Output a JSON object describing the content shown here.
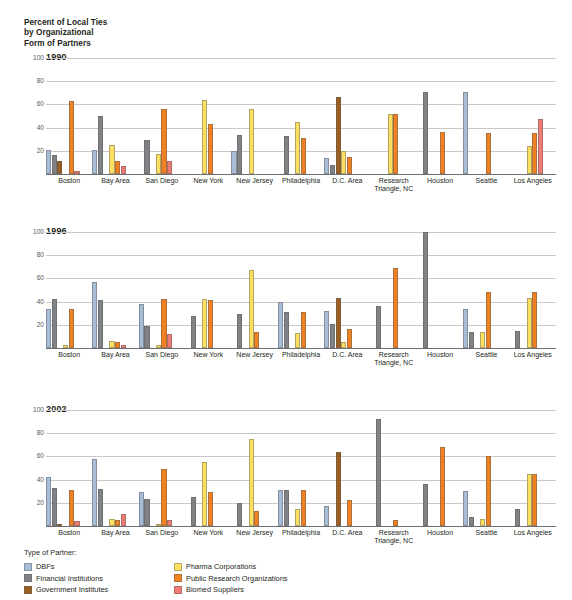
{
  "title_lines": [
    "Percent of Local Ties",
    "by Organizational",
    "Form of Partners"
  ],
  "legend": {
    "heading": "Type of Partner:",
    "columns": [
      [
        {
          "label": "DBFs",
          "color": "#a7bcd6"
        },
        {
          "label": "Financial Institutions",
          "color": "#808285"
        },
        {
          "label": "Government Institutes",
          "color": "#9c5f22"
        }
      ],
      [
        {
          "label": "Pharma Corporations",
          "color": "#fbdf62"
        },
        {
          "label": "Public Research Organizations",
          "color": "#ef8122"
        },
        {
          "label": "Biomed Suppliers",
          "color": "#ef7b74"
        }
      ]
    ]
  },
  "chart_data": {
    "type": "bar",
    "title": "Percent of Local Ties by Organizational Form of Partners",
    "xlabel": "",
    "ylabel": "Percent",
    "ylim": [
      0,
      100
    ],
    "yticks": [
      0,
      20,
      40,
      60,
      80,
      100
    ],
    "ytick_labels": [
      "",
      "20",
      "40",
      "60",
      "80",
      "100"
    ],
    "grid": true,
    "legend_position": "bottom-left",
    "categories": [
      "Boston",
      "Bay Area",
      "San Diego",
      "New York",
      "New Jersey",
      "Philadelphia",
      "D.C. Area",
      "Research Triangle, NC",
      "Houston",
      "Seattle",
      "Los Angeles"
    ],
    "category_lines": [
      [
        "Boston"
      ],
      [
        "Bay Area"
      ],
      [
        "San Diego"
      ],
      [
        "New York"
      ],
      [
        "New Jersey"
      ],
      [
        "Philadelphia"
      ],
      [
        "D.C. Area"
      ],
      [
        "Research",
        "Triangle, NC"
      ],
      [
        "Houston"
      ],
      [
        "Seattle"
      ],
      [
        "Los Angeles"
      ]
    ],
    "series_names": [
      "DBFs",
      "Financial Institutions",
      "Government Institutes",
      "Pharma Corporations",
      "Public Research Organizations",
      "Biomed Suppliers"
    ],
    "series_colors": [
      "#a7bcd6",
      "#808285",
      "#9c5f22",
      "#fbdf62",
      "#ef8122",
      "#ef7b74"
    ],
    "panels": [
      {
        "year": "1990",
        "series": [
          {
            "name": "DBFs",
            "values": [
              21,
              21,
              0,
              0,
              20,
              0,
              14,
              0,
              0,
              71,
              0
            ]
          },
          {
            "name": "Financial Institutions",
            "values": [
              16,
              50,
              29,
              0,
              34,
              33,
              8,
              0,
              71,
              0,
              0
            ]
          },
          {
            "name": "Government Institutes",
            "values": [
              11,
              0,
              0,
              0,
              0,
              0,
              66,
              0,
              0,
              0,
              0
            ]
          },
          {
            "name": "Pharma Corporations",
            "values": [
              0,
              25,
              17,
              64,
              56,
              45,
              20,
              52,
              0,
              0,
              24
            ]
          },
          {
            "name": "Public Research Organizations",
            "values": [
              63,
              11,
              56,
              43,
              0,
              31,
              15,
              52,
              36,
              35,
              35
            ]
          },
          {
            "name": "Biomed Suppliers",
            "values": [
              3,
              7,
              11,
              0,
              0,
              0,
              0,
              0,
              0,
              0,
              47
            ]
          }
        ]
      },
      {
        "year": "1996",
        "series": [
          {
            "name": "DBFs",
            "values": [
              34,
              57,
              38,
              0,
              0,
              40,
              32,
              0,
              0,
              34,
              0
            ]
          },
          {
            "name": "Financial Institutions",
            "values": [
              42,
              41,
              19,
              28,
              29,
              31,
              21,
              36,
              100,
              14,
              15
            ]
          },
          {
            "name": "Government Institutes",
            "values": [
              0,
              0,
              0,
              0,
              0,
              0,
              43,
              0,
              0,
              0,
              0
            ]
          },
          {
            "name": "Pharma Corporations",
            "values": [
              3,
              6,
              3,
              42,
              67,
              13,
              5,
              0,
              0,
              14,
              43
            ]
          },
          {
            "name": "Public Research Organizations",
            "values": [
              34,
              5,
              42,
              41,
              14,
              31,
              16,
              69,
              0,
              48,
              48
            ]
          },
          {
            "name": "Biomed Suppliers",
            "values": [
              0,
              3,
              12,
              0,
              0,
              0,
              0,
              0,
              0,
              0,
              0
            ]
          }
        ]
      },
      {
        "year": "2002",
        "series": [
          {
            "name": "DBFs",
            "values": [
              42,
              58,
              29,
              0,
              0,
              31,
              17,
              0,
              0,
              30,
              0
            ]
          },
          {
            "name": "Financial Institutions",
            "values": [
              33,
              32,
              23,
              25,
              20,
              31,
              0,
              92,
              36,
              8,
              15
            ]
          },
          {
            "name": "Government Institutes",
            "values": [
              1,
              0,
              0,
              0,
              0,
              0,
              64,
              0,
              0,
              0,
              0
            ]
          },
          {
            "name": "Pharma Corporations",
            "values": [
              0,
              6,
              1,
              55,
              75,
              15,
              0,
              0,
              0,
              6,
              45
            ]
          },
          {
            "name": "Public Research Organizations",
            "values": [
              31,
              5,
              49,
              29,
              13,
              31,
              22,
              5,
              68,
              60,
              45
            ]
          },
          {
            "name": "Biomed Suppliers",
            "values": [
              4,
              10,
              5,
              0,
              0,
              0,
              0,
              0,
              0,
              0,
              0
            ]
          }
        ]
      }
    ]
  },
  "panel_tops": [
    58,
    232,
    410
  ]
}
